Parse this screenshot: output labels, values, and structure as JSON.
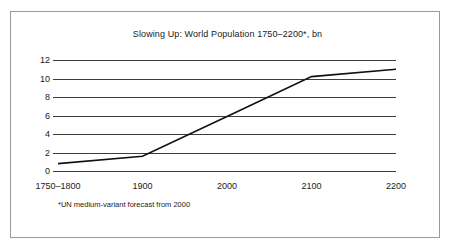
{
  "figure": {
    "background_color": "#ffffff",
    "frame_color": "#9a9a9a"
  },
  "chart_data": {
    "type": "line",
    "title": "Slowing Up: World Population 1750–2200*, bn",
    "subtitle": "",
    "xlabel": "",
    "ylabel": "",
    "categories": [
      "1750–1800",
      "1900",
      "2000",
      "2100",
      "2200"
    ],
    "values": [
      0.8,
      1.6,
      5.9,
      10.2,
      11.0
    ],
    "series": [
      {
        "name": "World population (bn)",
        "values": [
          0.8,
          1.6,
          5.9,
          10.2,
          11.0
        ],
        "color": "#111111"
      }
    ],
    "ylim": [
      0,
      12
    ],
    "yticks": [
      0,
      2,
      4,
      6,
      8,
      10,
      12
    ],
    "ytick_labels": [
      "0",
      "2",
      "4",
      "6",
      "8",
      "10",
      "12"
    ],
    "xtick_labels": [
      "1750–1800",
      "1900",
      "2000",
      "2100",
      "2200"
    ],
    "grid": true,
    "grid_axis": "y",
    "grid_color": "#3d3d3d",
    "legend": false,
    "legend_position": "none",
    "annotations": [
      "*UN medium-variant forecast from 2000"
    ],
    "line_color": "#111111",
    "line_width": 1.6
  },
  "footnote": {
    "text": "*UN medium-variant forecast from 2000"
  }
}
